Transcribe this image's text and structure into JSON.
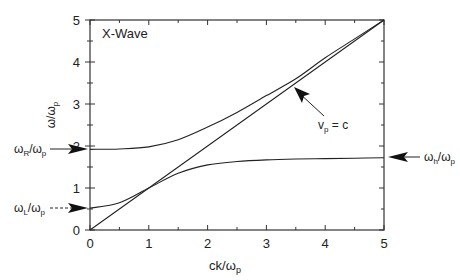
{
  "chart_data": {
    "type": "line",
    "title": "X-Wave",
    "xlabel": "ck/ωp",
    "ylabel": "ω/ωp",
    "xlim": [
      0,
      5
    ],
    "ylim": [
      0,
      5
    ],
    "xticks": [
      "0",
      "1",
      "2",
      "3",
      "4",
      "5"
    ],
    "yticks": [
      "0",
      "1",
      "2",
      "3",
      "4",
      "5"
    ],
    "grid": false,
    "series": [
      {
        "name": "upper branch (R-cutoff)",
        "x": [
          0,
          0.5,
          1,
          1.5,
          2,
          2.5,
          3,
          3.5,
          4,
          4.5,
          5
        ],
        "y": [
          1.92,
          1.93,
          1.98,
          2.15,
          2.45,
          2.8,
          3.2,
          3.6,
          4.1,
          4.55,
          5.0
        ]
      },
      {
        "name": "lower branch (L-cutoff to upper hybrid)",
        "x": [
          0,
          0.5,
          1,
          1.5,
          2,
          2.5,
          3,
          3.5,
          4,
          4.5,
          5
        ],
        "y": [
          0.52,
          0.65,
          1.0,
          1.35,
          1.55,
          1.63,
          1.67,
          1.69,
          1.7,
          1.71,
          1.72
        ]
      },
      {
        "name": "light line v_p = c",
        "x": [
          0,
          5
        ],
        "y": [
          0,
          5
        ]
      }
    ],
    "annotations": [
      {
        "text": "ωR/ωp",
        "y": 1.92,
        "side": "left"
      },
      {
        "text": "ωL/ωp",
        "y": 0.52,
        "side": "left"
      },
      {
        "text": "ωh/ωp",
        "y": 1.72,
        "side": "right"
      },
      {
        "text": "vp = c",
        "points_to": "light line"
      }
    ]
  },
  "labels": {
    "title": "X-Wave",
    "xlabel": "ck/ωp",
    "ylabel": "ω/ωp",
    "omega_R": "ωR/ωp",
    "omega_L": "ωL/ωp",
    "omega_h": "ωh/ωp",
    "vp": "vp = c"
  }
}
